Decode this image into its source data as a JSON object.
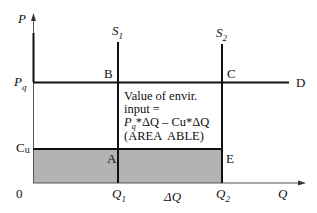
{
  "diagram": {
    "axes": {
      "y_label": "P",
      "x_label": "Q",
      "origin_label": "0"
    },
    "levels": {
      "pq_main": "P",
      "pq_sub": "q",
      "cu_main": "C",
      "cu_sub": "u"
    },
    "curves": {
      "s1_main": "S",
      "s1_sub": "1",
      "s2_main": "S",
      "s2_sub": "2",
      "demand": "D"
    },
    "points": {
      "a": "A",
      "b": "B",
      "c": "C",
      "e": "E"
    },
    "x_ticks": {
      "q1_main": "Q",
      "q1_sub": "1",
      "dq": "ΔQ",
      "q2_main": "Q",
      "q2_sub": "2"
    },
    "annotation": {
      "line1": "Value of envir.",
      "line2": "input =",
      "line3_p": "P",
      "line3_sub": "q",
      "line3_rest": "*ΔQ – Cu*ΔQ",
      "line4": "(AREA  ABLE)"
    },
    "colors": {
      "line": "#111111",
      "shade": "#b3b3b3",
      "axis": "#555555"
    }
  }
}
